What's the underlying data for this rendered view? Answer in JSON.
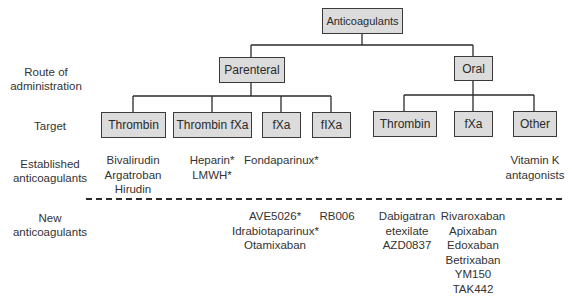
{
  "row_labels": {
    "route": [
      "Route of",
      "administration"
    ],
    "target": "Target",
    "established": [
      "Established",
      "anticoagulants"
    ],
    "new": [
      "New",
      "anticoagulants"
    ]
  },
  "tree": {
    "root": "Anticoagulants",
    "routes": [
      {
        "label": "Parenteral",
        "targets": [
          "Thrombin",
          "Thrombin fXa",
          "fXa",
          "fIXa"
        ]
      },
      {
        "label": "Oral",
        "targets": [
          "Thrombin",
          "fXa",
          "Other"
        ]
      }
    ]
  },
  "established": {
    "parenteral_thrombin": [
      "Bivalirudin",
      "Argatroban",
      "Hirudin"
    ],
    "parenteral_thrombin_fxa": [
      "Heparin*",
      "LMWH*"
    ],
    "parenteral_fxa": [
      "Fondaparinux*"
    ],
    "oral_other": [
      "Vitamin K",
      "antagonists"
    ]
  },
  "new": {
    "parenteral_fxa": [
      "AVE5026*",
      "Idrabiotaparinux*",
      "Otamixaban"
    ],
    "parenteral_fixa": [
      "RB006"
    ],
    "oral_thrombin": [
      "Dabigatran",
      "etexilate",
      "AZD0837"
    ],
    "oral_fxa": [
      "Rivaroxaban",
      "Apixaban",
      "Edoxaban",
      "Betrixaban",
      "YM150",
      "TAK442"
    ]
  },
  "colors": {
    "box_fill": "#dcdcdc",
    "box_border": "#3a3a3a",
    "line": "#2a2a2a",
    "text": "#2a2a2a"
  }
}
